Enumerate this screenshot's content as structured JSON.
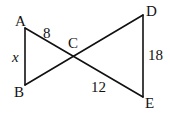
{
  "diagram": {
    "points": {
      "A": "A",
      "B": "B",
      "C": "C",
      "D": "D",
      "E": "E"
    },
    "segments": [
      {
        "name": "AB",
        "label": "x"
      },
      {
        "name": "AC",
        "label": "8"
      },
      {
        "name": "CE",
        "label": "12"
      },
      {
        "name": "DE",
        "label": "18"
      },
      {
        "name": "BC",
        "label": ""
      },
      {
        "name": "CD",
        "label": ""
      }
    ]
  }
}
